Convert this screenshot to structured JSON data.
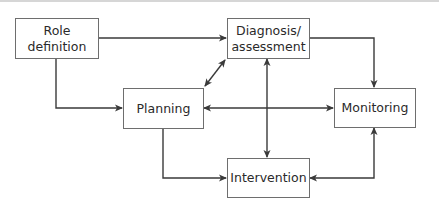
{
  "diagram": {
    "type": "flowchart",
    "nodes": [
      {
        "id": "role",
        "label": "Role\ndefinition"
      },
      {
        "id": "diag",
        "label": "Diagnosis/\nassessment"
      },
      {
        "id": "plan",
        "label": "Planning"
      },
      {
        "id": "mon",
        "label": "Monitoring"
      },
      {
        "id": "int",
        "label": "Intervention"
      }
    ],
    "edges": [
      {
        "from": "role",
        "to": "diag",
        "direction": "one-way"
      },
      {
        "from": "role",
        "to": "plan",
        "direction": "one-way"
      },
      {
        "from": "diag",
        "to": "plan",
        "direction": "two-way"
      },
      {
        "from": "diag",
        "to": "mon",
        "direction": "one-way"
      },
      {
        "from": "diag",
        "to": "int",
        "direction": "two-way"
      },
      {
        "from": "plan",
        "to": "mon",
        "direction": "two-way"
      },
      {
        "from": "plan",
        "to": "int",
        "direction": "one-way"
      },
      {
        "from": "int",
        "to": "mon",
        "direction": "two-way"
      }
    ],
    "colors": {
      "line": "#3a3a3a",
      "border": "#6e6e6e",
      "text": "#2a2a2a"
    }
  }
}
